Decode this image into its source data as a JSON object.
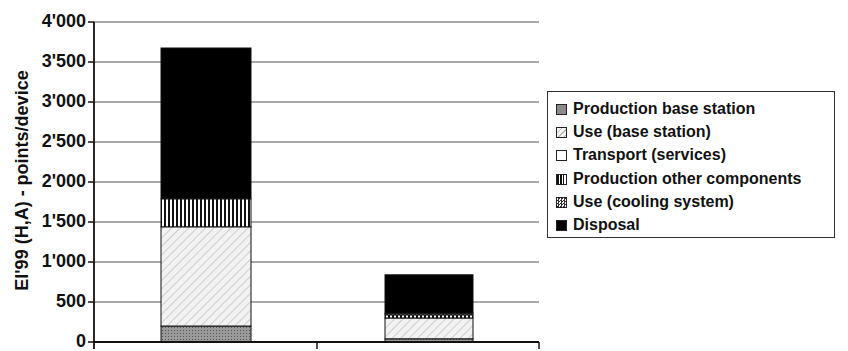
{
  "chart_data": {
    "type": "bar",
    "stacked": true,
    "title": "",
    "xlabel": "",
    "ylabel": "EI'99 (H,A) - points/device",
    "ylim": [
      0,
      4000
    ],
    "yticks": [
      "0",
      "500",
      "1'000",
      "1'500",
      "2'000",
      "2'500",
      "3'000",
      "3'500",
      "4'000"
    ],
    "categories": [
      "",
      ""
    ],
    "legend_position": "right",
    "series": [
      {
        "name": "Production base station",
        "values": [
          200,
          40
        ],
        "pattern": "gray-dots"
      },
      {
        "name": "Use (base station)",
        "values": [
          1240,
          260
        ],
        "pattern": "diagonal-hatch"
      },
      {
        "name": "Transport (services)",
        "values": [
          0,
          0
        ],
        "pattern": "white"
      },
      {
        "name": "Production other components",
        "values": [
          350,
          40
        ],
        "pattern": "vertical-lines"
      },
      {
        "name": "Use (cooling system)",
        "values": [
          0,
          20
        ],
        "pattern": "checker"
      },
      {
        "name": "Disposal",
        "values": [
          1885,
          480
        ],
        "pattern": "black"
      }
    ]
  },
  "legend": {
    "items": [
      "Production base station",
      "Use (base station)",
      "Transport (services)",
      "Production other components",
      "Use (cooling system)",
      "Disposal"
    ]
  }
}
